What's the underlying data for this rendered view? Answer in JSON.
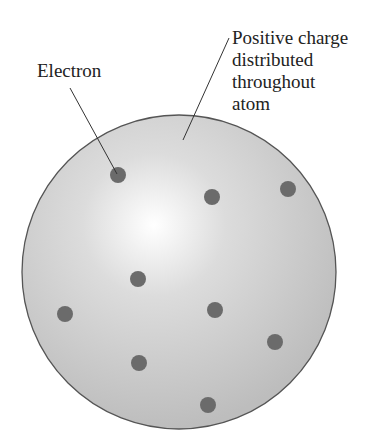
{
  "diagram": {
    "labels": {
      "electron": "Electron",
      "positive_charge": [
        "Positive charge",
        "distributed",
        "throughout",
        "atom"
      ]
    },
    "atom": {
      "cx": 179,
      "cy": 272,
      "r": 157,
      "fill": "#c8c8c8",
      "highlight": "#ffffff",
      "stroke": "#555555"
    },
    "electrons": [
      {
        "x": 118,
        "y": 175
      },
      {
        "x": 212,
        "y": 197
      },
      {
        "x": 288,
        "y": 189
      },
      {
        "x": 138,
        "y": 279
      },
      {
        "x": 65,
        "y": 314
      },
      {
        "x": 215,
        "y": 310
      },
      {
        "x": 275,
        "y": 342
      },
      {
        "x": 139,
        "y": 363
      },
      {
        "x": 208,
        "y": 405
      }
    ],
    "electron_color": "#6b6b6b",
    "electron_count": 9
  }
}
